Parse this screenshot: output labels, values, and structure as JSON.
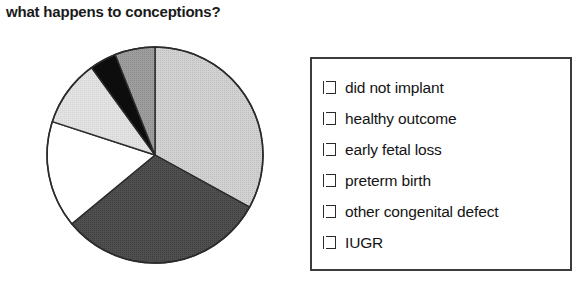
{
  "chart_data": {
    "type": "pie",
    "title": "what happens to conceptions?",
    "xlabel": "",
    "ylabel": "",
    "legend_position": "right",
    "grid": false,
    "start_angle_deg": 0,
    "direction": "clockwise",
    "categories": [
      "did not implant",
      "healthy outcome",
      "early fetal loss",
      "preterm birth",
      "other congenital defect",
      "IUGR"
    ],
    "values": [
      33,
      31,
      16,
      10,
      4,
      6
    ],
    "slice_colors": [
      "#c8c8c8",
      "#4f4f4f",
      "#ffffff",
      "#dcdcdc",
      "#0d0d0d",
      "#9a9a9a"
    ],
    "slices": [
      {
        "label": "did not implant",
        "value": 33,
        "color": "#c8c8c8"
      },
      {
        "label": "healthy outcome",
        "value": 31,
        "color": "#4f4f4f"
      },
      {
        "label": "early fetal loss",
        "value": 16,
        "color": "#ffffff"
      },
      {
        "label": "preterm birth",
        "value": 10,
        "color": "#dcdcdc"
      },
      {
        "label": "other congenital defect",
        "value": 4,
        "color": "#0d0d0d"
      },
      {
        "label": "IUGR",
        "value": 6,
        "color": "#9a9a9a"
      }
    ]
  },
  "title": {
    "text": "what happens to conceptions?"
  },
  "legend": {
    "items": [
      {
        "label": "did not implant",
        "color": "#c8c8c8"
      },
      {
        "label": "healthy outcome",
        "color": "#4f4f4f"
      },
      {
        "label": "early fetal loss",
        "color": "#ffffff"
      },
      {
        "label": "preterm birth",
        "color": "#dcdcdc"
      },
      {
        "label": "other congenital defect",
        "color": "#0d0d0d"
      },
      {
        "label": "IUGR",
        "color": "#9a9a9a"
      }
    ]
  },
  "colors": {
    "outline": "#2b2b2b",
    "legend_border": "#3c3c3c",
    "text": "#141414",
    "background": "#ffffff"
  }
}
